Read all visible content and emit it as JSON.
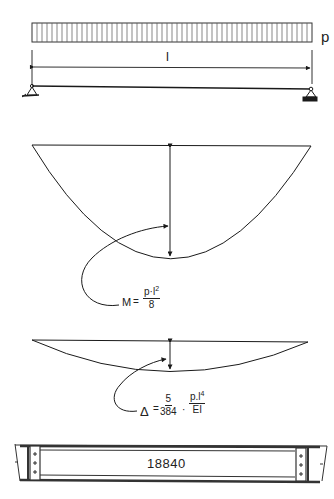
{
  "load_diagram": {
    "load_label": "p",
    "span_label": "l",
    "load_hatch_count": 56
  },
  "moment_diagram": {
    "formula_lhs": "M",
    "formula_eq": "=",
    "numerator": "p·l",
    "numerator_exp": "2",
    "denominator": "8"
  },
  "deflection_diagram": {
    "formula_lhs": "Δ",
    "formula_eq": "=",
    "coef_numerator": "5",
    "coef_denominator": "384",
    "dot": "·",
    "numerator": "p.l",
    "numerator_exp": "4",
    "denominator": "EI"
  },
  "girder_elevation": {
    "label": "18840"
  },
  "colors": {
    "ink": "#1a1a1a",
    "background": "#ffffff"
  }
}
